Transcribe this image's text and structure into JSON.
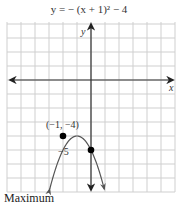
{
  "chart_data": {
    "type": "line",
    "title": "y = − (x + 1)² − 4",
    "xlabel": "x",
    "ylabel": "y",
    "equation": "y = -(x + 1)^2 - 4",
    "xlim": [
      -6,
      6
    ],
    "ylim": [
      -8,
      4
    ],
    "grid": true,
    "annotations": [
      {
        "label": "(−1, −4)",
        "x": -1,
        "y": -4,
        "kind": "vertex"
      },
      {
        "label": "−5",
        "x": 0,
        "y": -5,
        "kind": "y-intercept"
      }
    ],
    "points": [
      {
        "x": -1,
        "y": -4
      },
      {
        "x": 0,
        "y": -5
      }
    ],
    "caption": "Maximum",
    "colors": {
      "grid": "#cfcfcf",
      "axis": "#333333",
      "curve": "#555555",
      "point": "#000000"
    }
  },
  "labels": {
    "title": "y = − (x + 1)² − 4",
    "x_axis": "x",
    "y_axis": "y",
    "vertex": "(−1, −4)",
    "y_intercept": "−5",
    "caption": "Maximum"
  }
}
